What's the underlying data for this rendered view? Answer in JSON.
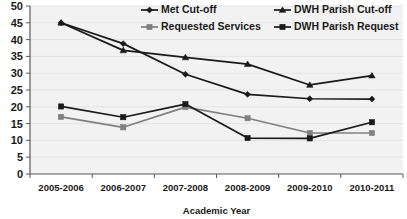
{
  "chart_data": {
    "type": "line",
    "title": "",
    "xlabel": "Academic Year",
    "ylabel": "",
    "categories": [
      "2005-2006",
      "2006-2007",
      "2007-2008",
      "2008-2009",
      "2009-2010",
      "2010-2011"
    ],
    "ylim": [
      0,
      50
    ],
    "ytick_step": 5,
    "yticks": [
      "0",
      "5",
      "10",
      "15",
      "20",
      "25",
      "30",
      "35",
      "40",
      "45",
      "50"
    ],
    "grid": true,
    "grid_axis": "y",
    "legend_position": "top",
    "series": [
      {
        "name": "Met Cut-off",
        "marker": "diamond",
        "color": "#1a1a1a",
        "values": [
          45,
          38.8,
          29.7,
          23.7,
          22.4,
          22.3
        ]
      },
      {
        "name": "DWH Parish Cut-off",
        "marker": "triangle",
        "color": "#1a1a1a",
        "values": [
          45,
          36.8,
          34.7,
          32.7,
          26.5,
          29.3
        ]
      },
      {
        "name": "Requested Services",
        "marker": "square",
        "color": "#808080",
        "values": [
          17,
          13.9,
          19.9,
          16.6,
          12.2,
          12.2
        ]
      },
      {
        "name": "DWH Parish Request",
        "marker": "square",
        "color": "#1a1a1a",
        "values": [
          20.1,
          16.9,
          20.8,
          10.7,
          10.6,
          15.4
        ]
      }
    ]
  },
  "colors": {
    "plot_background": "#f2f2f2",
    "grid": "#e4e4e4",
    "axis": "#595959",
    "text": "#1a1a1a",
    "series_dark": "#1a1a1a",
    "series_gray": "#808080"
  }
}
